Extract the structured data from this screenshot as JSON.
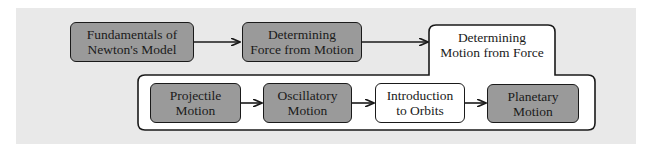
{
  "diagram": {
    "type": "flowchart",
    "colors": {
      "panel_background": "#e9e9e9",
      "filled_node": "#9a9a9a",
      "open_node": "#ffffff",
      "stroke": "#1a1a1a"
    },
    "top_row": [
      {
        "id": "fundamentals",
        "label": "Fundamentals of\nNewton's Model",
        "style": "filled"
      },
      {
        "id": "force-from-motion",
        "label": "Determining\nForce from Motion",
        "style": "filled"
      },
      {
        "id": "motion-from-force",
        "label": "Determining\nMotion from Force",
        "style": "open",
        "is_container": true
      }
    ],
    "container_children": [
      {
        "id": "projectile",
        "label": "Projectile\nMotion",
        "style": "filled"
      },
      {
        "id": "oscillatory",
        "label": "Oscillatory\nMotion",
        "style": "filled"
      },
      {
        "id": "orbits-intro",
        "label": "Introduction\nto Orbits",
        "style": "open"
      },
      {
        "id": "planetary",
        "label": "Planetary\nMotion",
        "style": "filled"
      }
    ],
    "edges": [
      {
        "from": "fundamentals",
        "to": "force-from-motion"
      },
      {
        "from": "force-from-motion",
        "to": "motion-from-force"
      },
      {
        "from": "projectile",
        "to": "oscillatory"
      },
      {
        "from": "oscillatory",
        "to": "orbits-intro"
      },
      {
        "from": "orbits-intro",
        "to": "planetary"
      }
    ]
  }
}
